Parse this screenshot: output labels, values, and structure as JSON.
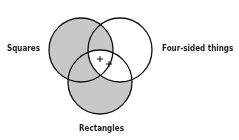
{
  "diagram": {
    "type": "venn",
    "sets": [
      {
        "name": "Squares",
        "cx": 81,
        "cy": 50,
        "r": 32
      },
      {
        "name": "Four-sided things",
        "cx": 120,
        "cy": 50,
        "r": 32
      },
      {
        "name": "Rectangles",
        "cx": 100,
        "cy": 82,
        "r": 32
      }
    ],
    "labels": {
      "left": "Squares",
      "right": "Four-sided things",
      "bottom": "Rectangles"
    },
    "markers": [
      "+",
      "+"
    ],
    "colors": {
      "shade": "#c8c8c8",
      "stroke": "#111111",
      "background": "#ffffff"
    },
    "shaded_regions": [
      "Squares only",
      "Squares and Four-sided things, not Rectangles",
      "Squares and Rectangles, not Four-sided things",
      "Rectangles only"
    ],
    "marked_region": "Squares and Four-sided things and Rectangles"
  }
}
